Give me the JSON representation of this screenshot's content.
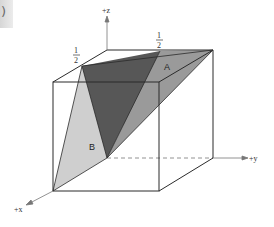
{
  "corner_tab": {
    "glyph": ")"
  },
  "axes": {
    "z": {
      "label": "+z"
    },
    "y": {
      "label": "+y"
    },
    "x": {
      "label": "+x"
    }
  },
  "fractions": [
    {
      "numerator": "1",
      "denominator": "2",
      "position": "left-top-edge"
    },
    {
      "numerator": "1",
      "denominator": "2",
      "position": "back-top-edge"
    }
  ],
  "regions": [
    {
      "label": "A",
      "shade": "#8c8c8c"
    },
    {
      "label": "B",
      "shade": "#cfcfcf"
    },
    {
      "label": "",
      "shade": "#555555",
      "role": "dark-center"
    }
  ],
  "colors": {
    "edge": "#2b2b2b",
    "axis": "#777777",
    "light": "#cfcfcf",
    "mid": "#8c8c8c",
    "dark": "#555555"
  }
}
